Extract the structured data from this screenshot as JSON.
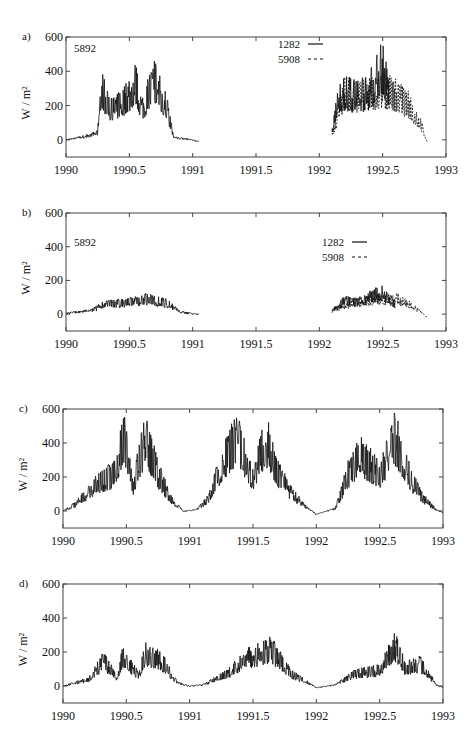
{
  "chart_data": [
    {
      "panel": "a)",
      "type": "line",
      "xlabel": "",
      "ylabel": "W / m²",
      "xlim": [
        1990,
        1993
      ],
      "ylim": [
        -100,
        600
      ],
      "xticks": [
        "1990",
        "1990.5",
        "1991",
        "1991.5",
        "1992",
        "1992.5",
        "1993"
      ],
      "yticks": [
        "0",
        "200",
        "400",
        "600"
      ],
      "annotation": "5892",
      "legend": [
        {
          "label": "1282",
          "style": "solid"
        },
        {
          "label": "5908",
          "style": "dashed"
        }
      ],
      "series": [
        {
          "name": "5892",
          "style": "solid",
          "x": [
            1990.0,
            1990.1,
            1990.2,
            1990.25,
            1990.28,
            1990.35,
            1990.45,
            1990.55,
            1990.6,
            1990.7,
            1990.8,
            1990.85,
            1990.95,
            1991.05
          ],
          "y": [
            0,
            20,
            40,
            60,
            410,
            250,
            300,
            450,
            250,
            480,
            250,
            20,
            10,
            -10
          ]
        },
        {
          "name": "1282",
          "style": "solid",
          "x": [
            1992.1,
            1992.15,
            1992.2,
            1992.3,
            1992.4,
            1992.5,
            1992.55
          ],
          "y": [
            50,
            350,
            380,
            350,
            400,
            600,
            400
          ]
        },
        {
          "name": "5908",
          "style": "dashed",
          "x": [
            1992.1,
            1992.2,
            1992.3,
            1992.5,
            1992.6,
            1992.7,
            1992.8,
            1992.85
          ],
          "y": [
            40,
            380,
            350,
            400,
            370,
            290,
            130,
            -10
          ]
        }
      ]
    },
    {
      "panel": "b)",
      "type": "line",
      "xlabel": "",
      "ylabel": "W / m²",
      "xlim": [
        1990,
        1993
      ],
      "ylim": [
        -100,
        600
      ],
      "xticks": [
        "1990",
        "1990.5",
        "1991",
        "1991.5",
        "1992",
        "1992.5",
        "1993"
      ],
      "yticks": [
        "0",
        "200",
        "400",
        "600"
      ],
      "annotation": "5892",
      "legend": [
        {
          "label": "1282",
          "style": "solid"
        },
        {
          "label": "5908",
          "style": "dashed"
        }
      ],
      "series": [
        {
          "name": "5892",
          "style": "solid",
          "x": [
            1990.0,
            1990.1,
            1990.2,
            1990.3,
            1990.5,
            1990.65,
            1990.8,
            1990.9,
            1991.05
          ],
          "y": [
            10,
            20,
            30,
            80,
            100,
            130,
            90,
            20,
            0
          ]
        },
        {
          "name": "1282",
          "style": "solid",
          "x": [
            1992.1,
            1992.2,
            1992.3,
            1992.5,
            1992.6
          ],
          "y": [
            30,
            110,
            100,
            180,
            80
          ]
        },
        {
          "name": "5908",
          "style": "dashed",
          "x": [
            1992.1,
            1992.3,
            1992.6,
            1992.75,
            1992.85
          ],
          "y": [
            40,
            100,
            140,
            60,
            -20
          ]
        }
      ]
    },
    {
      "panel": "c)",
      "type": "line",
      "xlabel": "",
      "ylabel": "W / m²",
      "xlim": [
        1990,
        1993
      ],
      "ylim": [
        -100,
        600
      ],
      "xticks": [
        "1990",
        "1990.5",
        "1991",
        "1991.5",
        "1992",
        "1992.5",
        "1993"
      ],
      "yticks": [
        "0",
        "200",
        "400",
        "600"
      ],
      "series": [
        {
          "name": "series",
          "style": "solid",
          "x": [
            1990.0,
            1990.1,
            1990.2,
            1990.3,
            1990.4,
            1990.48,
            1990.55,
            1990.65,
            1990.75,
            1990.85,
            1990.95,
            1991.05,
            1991.15,
            1991.25,
            1991.38,
            1991.5,
            1991.6,
            1991.7,
            1991.8,
            1991.9,
            1992.0,
            1992.15,
            1992.25,
            1992.35,
            1992.5,
            1992.62,
            1992.75,
            1992.85,
            1992.95,
            1993.0
          ],
          "y": [
            0,
            60,
            150,
            250,
            300,
            600,
            200,
            600,
            300,
            100,
            0,
            10,
            100,
            380,
            600,
            250,
            600,
            300,
            150,
            50,
            -20,
            20,
            300,
            450,
            300,
            600,
            250,
            100,
            10,
            -10
          ]
        }
      ]
    },
    {
      "panel": "d)",
      "type": "line",
      "xlabel": "",
      "ylabel": "W / m²",
      "xlim": [
        1990,
        1993
      ],
      "ylim": [
        -100,
        600
      ],
      "xticks": [
        "1990",
        "1990.5",
        "1991",
        "1991.5",
        "1992",
        "1992.5",
        "1993"
      ],
      "yticks": [
        "0",
        "200",
        "400",
        "600"
      ],
      "series": [
        {
          "name": "series",
          "style": "solid",
          "x": [
            1990.0,
            1990.1,
            1990.2,
            1990.32,
            1990.43,
            1990.47,
            1990.6,
            1990.65,
            1990.78,
            1990.9,
            1991.0,
            1991.1,
            1991.3,
            1991.45,
            1991.64,
            1991.8,
            1991.95,
            1992.0,
            1992.15,
            1992.3,
            1992.5,
            1992.62,
            1992.7,
            1992.82,
            1992.95,
            1993.0
          ],
          "y": [
            0,
            30,
            50,
            210,
            60,
            240,
            80,
            270,
            200,
            30,
            0,
            10,
            100,
            230,
            300,
            100,
            20,
            -10,
            10,
            100,
            130,
            330,
            150,
            180,
            10,
            -10
          ]
        }
      ]
    }
  ],
  "panels": [
    {
      "label": "a)",
      "ylabel": "W / m²",
      "annotation": "5892",
      "legend1": "1282",
      "legend2": "5908"
    },
    {
      "label": "b)",
      "ylabel": "W / m²",
      "annotation": "5892",
      "legend1": "1282",
      "legend2": "5908"
    },
    {
      "label": "c)",
      "ylabel": "W / m²"
    },
    {
      "label": "d)",
      "ylabel": "W / m²"
    }
  ],
  "yticks": [
    "0",
    "200",
    "400",
    "600"
  ],
  "xticks": [
    "1990",
    "1990.5",
    "1991",
    "1991.5",
    "1992",
    "1992.5",
    "1993"
  ]
}
